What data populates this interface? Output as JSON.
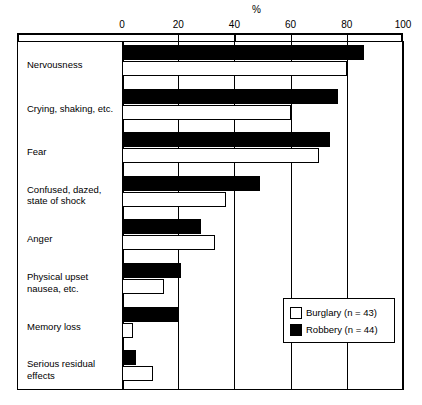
{
  "chart_data": {
    "type": "bar",
    "orientation": "horizontal",
    "title": "",
    "xlabel": "%",
    "ylabel": "",
    "xlim": [
      0,
      100
    ],
    "xticks": [
      0,
      20,
      40,
      60,
      80,
      100
    ],
    "grid": true,
    "legend_position": "bottom-right",
    "categories": [
      "Nervousness",
      "Crying, shaking, etc.",
      "Fear",
      "Confused, dazed,\nstate of shock",
      "Anger",
      "Physical upset\nnausea, etc.",
      "Memory loss",
      "Serious residual\neffects"
    ],
    "series": [
      {
        "name": "Burglary (n = 43)",
        "color": "#ffffff",
        "values": [
          80,
          60,
          70,
          37,
          33,
          15,
          4,
          11
        ]
      },
      {
        "name": "Robbery (n = 44)",
        "color": "#000000",
        "values": [
          86,
          77,
          74,
          49,
          28,
          21,
          20,
          5
        ]
      }
    ]
  },
  "axis": {
    "unit_label": "%",
    "tick_labels": [
      "0",
      "20",
      "40",
      "60",
      "80",
      "100"
    ]
  },
  "legend": {
    "entries": [
      {
        "label": "Burglary (n = 43)",
        "swatch": "white"
      },
      {
        "label": "Robbery (n = 44)",
        "swatch": "black"
      }
    ]
  }
}
